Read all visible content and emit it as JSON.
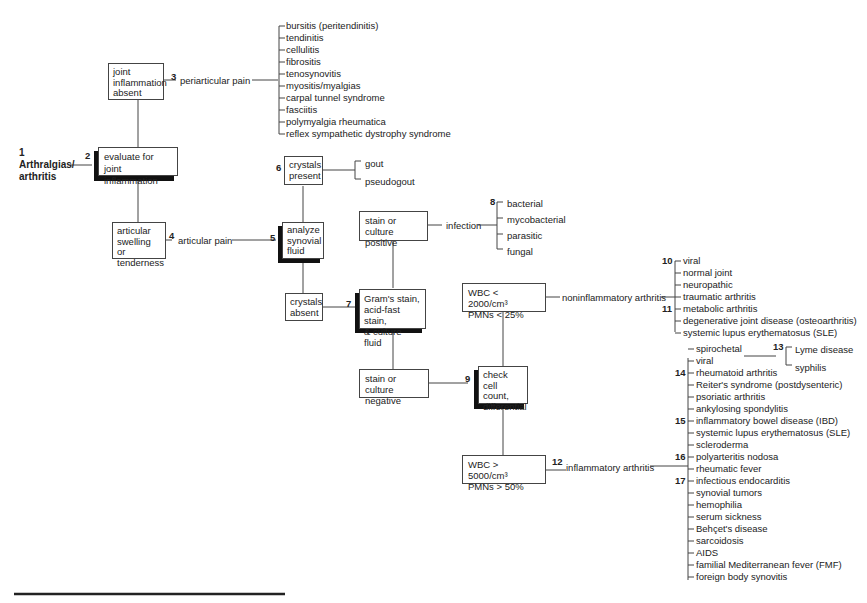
{
  "title": {
    "number": "1",
    "line1": "Arthralgias/",
    "line2": "arthritis"
  },
  "nodes": {
    "evaluate": {
      "number": "2",
      "text1": "evaluate for",
      "text2": "joint inflammation"
    },
    "absent": {
      "text1": "joint",
      "text2": "inflammation",
      "text3": "absent"
    },
    "periarticular": {
      "number": "3",
      "label": "periarticular pain"
    },
    "swelling": {
      "text1": "articular",
      "text2": "swelling or",
      "text3": "tenderness"
    },
    "articular": {
      "number": "4",
      "label": "articular pain"
    },
    "analyze": {
      "number": "5",
      "text1": "analyze",
      "text2": "synovial",
      "text3": "fluid"
    },
    "crystals_present": {
      "number": "6",
      "text1": "crystals",
      "text2": "present"
    },
    "crystals_absent": {
      "text1": "crystals",
      "text2": "absent"
    },
    "gram": {
      "number": "7",
      "text1": "Gram's stain,",
      "text2": "acid-fast stain,",
      "text3": "& culture fluid"
    },
    "positive": {
      "text1": "stain or culture",
      "text2": "positive"
    },
    "infection": {
      "number": "8",
      "label": "infection"
    },
    "negative": {
      "text1": "stain or culture",
      "text2": "negative"
    },
    "check": {
      "number": "9",
      "text1": "check",
      "text2": "cell count,",
      "text3": "differential"
    },
    "wbc_low": {
      "text1": "WBC < 2000/cm³",
      "text2": "PMNs < 25%"
    },
    "noninflammatory": {
      "label": "noninflammatory arthritis"
    },
    "wbc_high": {
      "text1": "WBC > 5000/cm³",
      "text2": "PMNs > 50%"
    },
    "inflammatory": {
      "number": "12",
      "label": "inflammatory arthritis"
    }
  },
  "lists": {
    "periarticular": [
      "bursitis (peritendinitis)",
      "tendinitis",
      "cellulitis",
      "fibrositis",
      "tenosynovitis",
      "myositis/myalgias",
      "carpal tunnel syndrome",
      "fasciitis",
      "polymyalgia rheumatica",
      "reflex sympathetic dystrophy syndrome"
    ],
    "crystals": [
      "gout",
      "pseudogout"
    ],
    "infection": [
      "bacterial",
      "mycobacterial",
      "parasitic",
      "fungal"
    ],
    "noninflammatory": [
      "viral",
      "normal joint",
      "neuropathic",
      "traumatic arthritis",
      "metabolic arthritis",
      "degenerative joint disease (osteoarthritis)",
      "systemic lupus erythematosus (SLE)"
    ],
    "noninflammatory_numbers": {
      "n10": "10",
      "n11": "11"
    },
    "spirochetal": [
      "Lyme disease",
      "syphilis"
    ],
    "spirochetal_number": "13",
    "inflammatory": [
      "spirochetal",
      "viral",
      "rheumatoid arthritis",
      "Reiter's syndrome (postdysenteric)",
      "psoriatic arthritis",
      "ankylosing spondylitis",
      "inflammatory bowel disease (IBD)",
      "systemic lupus erythematosus (SLE)",
      "scleroderma",
      "polyarteritis nodosa",
      "rheumatic fever",
      "infectious endocarditis",
      "synovial tumors",
      "hemophilia",
      "serum sickness",
      "Behçet's disease",
      "sarcoidosis",
      "AIDS",
      "familial Mediterranean fever (FMF)",
      "foreign body synovitis"
    ],
    "inflammatory_numbers": {
      "n14": "14",
      "n15": "15",
      "n16": "16",
      "n17": "17"
    }
  }
}
